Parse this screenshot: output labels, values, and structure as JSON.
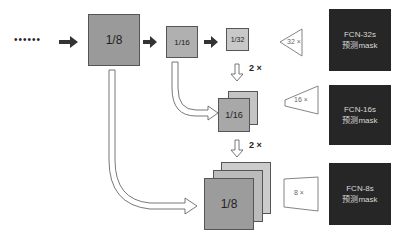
{
  "diagram": {
    "input_dots": "••••••",
    "pool3": {
      "label": "1/8"
    },
    "pool4": {
      "label": "1/16"
    },
    "pool5": {
      "label": "1/32"
    },
    "stage16": {
      "label": "1/16"
    },
    "stage8": {
      "label": "1/8"
    },
    "upsample_labels": [
      "2 ×",
      "2 ×"
    ],
    "outputs": [
      {
        "scale": "32 ×",
        "name": "FCN-32s",
        "caption": "预测mask"
      },
      {
        "scale": "16 ×",
        "name": "FCN-16s",
        "caption": "预测mask"
      },
      {
        "scale": "8 ×",
        "name": "FCN-8s",
        "caption": "预测mask"
      }
    ]
  },
  "colors": {
    "box_dark": "#9a9a9a",
    "box_mid": "#b4b4b4",
    "box_light": "#c8c8c8",
    "output_bg": "#262626",
    "arrow": "#333333"
  }
}
